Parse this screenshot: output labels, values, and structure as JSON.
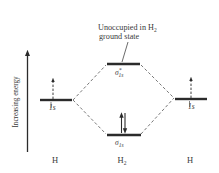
{
  "diagram": {
    "type": "molecular-orbital-energy-diagram",
    "axis": {
      "label": "Increasing energy",
      "direction": "up"
    },
    "annotation": {
      "line1_prefix": "Unoccupied in H",
      "line1_sub": "2",
      "line2": "ground state",
      "points_to": "sigma_star_1s"
    },
    "levels": [
      {
        "id": "left-h-1s",
        "label": "1s",
        "electrons": 1,
        "spin": [
          "up"
        ]
      },
      {
        "id": "sigma-star-1s",
        "label_main": "σ",
        "label_sup": "*",
        "label_sub": "1s",
        "electrons": 0,
        "spin": []
      },
      {
        "id": "sigma-1s",
        "label_main": "σ",
        "label_sub": "1s",
        "electrons": 2,
        "spin": [
          "up",
          "down"
        ]
      },
      {
        "id": "right-h-1s",
        "label": "1s",
        "electrons": 1,
        "spin": [
          "up"
        ]
      }
    ],
    "atoms": {
      "left": "H",
      "middle_main": "H",
      "middle_sub": "2",
      "right": "H"
    },
    "colors": {
      "line": "#2b2b2b",
      "text": "#3a3a3a",
      "background": "#ffffff"
    }
  }
}
